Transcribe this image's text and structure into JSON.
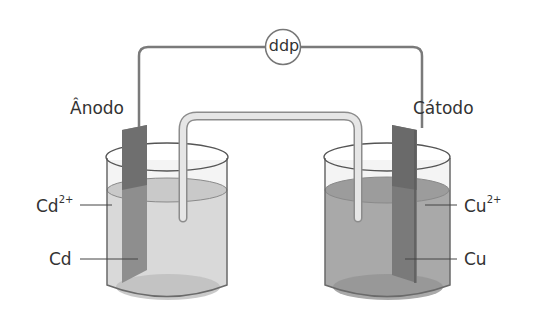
{
  "diagram": {
    "meter_label": "ddp",
    "anode": {
      "label": "Ânodo",
      "electrode": "Cd",
      "ion": "Cd",
      "ion_charge": "2+"
    },
    "cathode": {
      "label": "Cátodo",
      "electrode": "Cu",
      "ion": "Cu",
      "ion_charge": "2+"
    },
    "colors": {
      "wire": "#7a7a7a",
      "anode_solution": "#d4d4d4",
      "cathode_solution": "#a8a8a8",
      "electrode": "#7e7e7e",
      "glass_outline": "#6a6a6a"
    }
  }
}
